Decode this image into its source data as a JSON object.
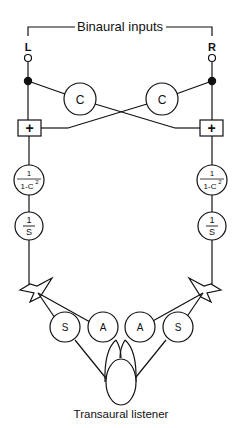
{
  "diagram": {
    "title": "Binaural inputs",
    "inputs": {
      "left": "L",
      "right": "R"
    },
    "crossfeed": {
      "left": "C",
      "right": "C"
    },
    "summers": {
      "left": "+",
      "right": "+"
    },
    "equalizer": {
      "numerator": "1",
      "denominator": "1-C",
      "exponent": "2"
    },
    "speaker_filter": {
      "numerator": "1",
      "denominator": "S"
    },
    "paths": [
      "S",
      "A",
      "A",
      "S"
    ],
    "listener_label": "Transaural listener"
  }
}
